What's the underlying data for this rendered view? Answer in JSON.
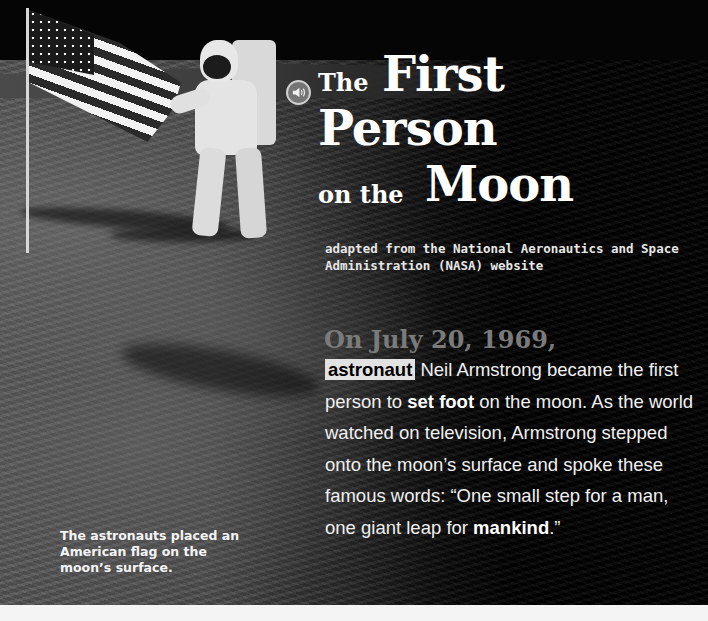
{
  "title": {
    "line1_small": "The",
    "line1_big": "First",
    "line2_big": "Person",
    "line3_small": "on the",
    "line3_big": "Moon"
  },
  "audio_button": {
    "icon": "speaker-icon"
  },
  "subtitle": "adapted from the National Aeronautics and Space Administration (NASA) website",
  "article": {
    "lead": "On July 20, 1969,",
    "vocab_word_1": "astronaut",
    "text_1": " Neil Armstrong became the first person to ",
    "vocab_word_2": "set foot",
    "text_2": " on the moon. As the world watched on television, Armstrong stepped onto the moon’s surface and spoke these famous words: “One small step for a man, one giant leap for ",
    "vocab_word_3": "mankind",
    "text_3": ".”"
  },
  "photo": {
    "caption": "The astronauts placed an American flag on the moon’s surface."
  },
  "colors": {
    "background": "#000000",
    "title_text": "#ffffff",
    "lead_text": "#7b7b7b",
    "vocab_highlight": "#e2e2e2"
  }
}
